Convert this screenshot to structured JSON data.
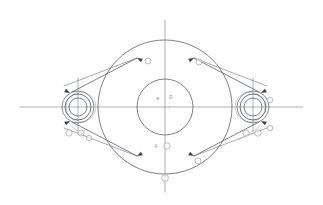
{
  "drawing": {
    "title": "Flange Plate Outline Sketch",
    "type": "cad-2d-technical-drawing",
    "canvas": {
      "width": 323,
      "height": 205,
      "background": "#ffffff"
    },
    "colors": {
      "geometry_line": "#5c6066",
      "centerline": "#8a8d92",
      "annotation_gray": "#b4b4b4",
      "annotation_text": "#9a9a9a",
      "marker_fill": "#ffffff",
      "arrow_fill": "#3c4046"
    },
    "main_circle": {
      "name": "main-outer-circle",
      "cx": 165,
      "cy": 107,
      "r": 67,
      "stroke": "#5c6066",
      "stroke_width": 0.8
    },
    "inner_circle": {
      "name": "main-inner-circle",
      "cx": 165,
      "cy": 107,
      "r": 28,
      "stroke": "#5c6066",
      "stroke_width": 0.8
    },
    "left_boss": {
      "name": "left-boss",
      "cx": 78,
      "cy": 107,
      "circles": [
        {
          "r": 16,
          "stroke": "#6a6e74",
          "stroke_width": 0.8
        },
        {
          "r": 13,
          "stroke": "#5c6066",
          "stroke_width": 0.9
        },
        {
          "r": 9,
          "stroke": "#5c6066",
          "stroke_width": 0.8
        }
      ],
      "ghost_circle": {
        "cx": 81,
        "cy": 107,
        "r": 15,
        "stroke": "#c2c2c2",
        "stroke_width": 0.8
      }
    },
    "right_boss": {
      "name": "right-boss",
      "cx": 253,
      "cy": 107,
      "circles": [
        {
          "r": 16,
          "stroke": "#6a6e74",
          "stroke_width": 0.8
        },
        {
          "r": 13,
          "stroke": "#5c6066",
          "stroke_width": 0.9
        },
        {
          "r": 9,
          "stroke": "#5c6066",
          "stroke_width": 0.8
        }
      ],
      "ghost_circle": {
        "cx": 250,
        "cy": 107,
        "r": 15,
        "stroke": "#c2c2c2",
        "stroke_width": 0.8
      }
    },
    "centerlines": [
      {
        "name": "horizontal-main-centerline",
        "x1": 20,
        "y1": 107,
        "x2": 303,
        "y2": 107,
        "stroke": "#8a8d92",
        "stroke_width": 0.7
      },
      {
        "name": "vertical-main-centerline",
        "x1": 165,
        "y1": 20,
        "x2": 165,
        "y2": 192,
        "stroke": "#8a8d92",
        "stroke_width": 0.7
      },
      {
        "name": "vertical-left-boss-centerline",
        "x1": 78,
        "y1": 78,
        "x2": 78,
        "y2": 132,
        "stroke": "#8a8d92",
        "stroke_width": 0.7
      },
      {
        "name": "vertical-right-boss-centerline",
        "x1": 253,
        "y1": 78,
        "x2": 253,
        "y2": 132,
        "stroke": "#8a8d92",
        "stroke_width": 0.7
      }
    ],
    "tangent_lines": [
      {
        "name": "tangent-upper-left",
        "x1": 72,
        "y1": 92,
        "x2": 137,
        "y2": 58,
        "stroke": "#5c6066",
        "stroke_width": 0.8
      },
      {
        "name": "tangent-upper-right",
        "x1": 259,
        "y1": 92,
        "x2": 194,
        "y2": 58,
        "stroke": "#5c6066",
        "stroke_width": 0.8
      },
      {
        "name": "tangent-lower-left",
        "x1": 72,
        "y1": 122,
        "x2": 137,
        "y2": 156,
        "stroke": "#5c6066",
        "stroke_width": 0.8
      },
      {
        "name": "tangent-lower-right",
        "x1": 259,
        "y1": 122,
        "x2": 194,
        "y2": 156,
        "stroke": "#5c6066",
        "stroke_width": 0.8
      },
      {
        "name": "leader-upper-left-secondary",
        "x1": 64,
        "y1": 86,
        "x2": 137,
        "y2": 58,
        "stroke": "#6a6e74",
        "stroke_width": 0.6
      },
      {
        "name": "leader-upper-right-secondary",
        "x1": 267,
        "y1": 86,
        "x2": 194,
        "y2": 58,
        "stroke": "#6a6e74",
        "stroke_width": 0.6
      },
      {
        "name": "leader-lower-left-secondary",
        "x1": 64,
        "y1": 128,
        "x2": 137,
        "y2": 156,
        "stroke": "#6a6e74",
        "stroke_width": 0.6
      },
      {
        "name": "leader-lower-right-secondary",
        "x1": 267,
        "y1": 128,
        "x2": 194,
        "y2": 156,
        "stroke": "#6a6e74",
        "stroke_width": 0.6
      }
    ],
    "arrow_markers": [
      {
        "name": "arrow-arc-upper-left",
        "x": 137,
        "y": 58,
        "angle": 208
      },
      {
        "name": "arrow-arc-upper-right",
        "x": 194,
        "y": 58,
        "angle": 332
      },
      {
        "name": "arrow-arc-lower-left",
        "x": 137,
        "y": 156,
        "angle": 152
      },
      {
        "name": "arrow-arc-lower-right",
        "x": 194,
        "y": 156,
        "angle": 28
      },
      {
        "name": "arrow-left-boss-upper",
        "x": 70,
        "y": 93,
        "angle": 28
      },
      {
        "name": "arrow-left-boss-lower",
        "x": 70,
        "y": 121,
        "angle": 332
      },
      {
        "name": "arrow-right-boss-upper",
        "x": 261,
        "y": 93,
        "angle": 152
      },
      {
        "name": "arrow-right-boss-lower",
        "x": 261,
        "y": 121,
        "angle": 208
      }
    ],
    "dimension_markers": [
      {
        "name": "marker-arc-upper-left",
        "cx": 148,
        "cy": 61,
        "r": 3.0
      },
      {
        "name": "marker-arc-upper-right",
        "cx": 199,
        "cy": 62,
        "r": 3.0
      },
      {
        "name": "marker-arc-lower-right",
        "cx": 198,
        "cy": 161,
        "r": 3.0
      },
      {
        "name": "marker-bottom-centerline",
        "cx": 165,
        "cy": 178,
        "r": 3.4
      },
      {
        "name": "marker-below-inner-circle",
        "cx": 167,
        "cy": 146,
        "r": 3.2
      },
      {
        "name": "marker-left-boss-a",
        "cx": 69,
        "cy": 133,
        "r": 3.2
      },
      {
        "name": "marker-left-boss-b",
        "cx": 81,
        "cy": 133,
        "r": 3.0
      },
      {
        "name": "marker-left-boss-c",
        "cx": 89,
        "cy": 138,
        "r": 2.6
      },
      {
        "name": "marker-right-boss-a",
        "cx": 246,
        "cy": 133,
        "r": 3.2
      },
      {
        "name": "marker-right-boss-b",
        "cx": 258,
        "cy": 133,
        "r": 3.2
      },
      {
        "name": "marker-right-boss-c",
        "cx": 270,
        "cy": 128,
        "r": 2.8
      },
      {
        "name": "marker-right-boss-d",
        "cx": 270,
        "cy": 100,
        "r": 2.8
      }
    ],
    "text_annotations": [
      {
        "name": "label-inner-left",
        "text": "ø",
        "x": 158,
        "y": 100
      },
      {
        "name": "label-inner-right",
        "text": "R",
        "x": 171,
        "y": 99
      },
      {
        "name": "label-inner-below",
        "text": "⏐",
        "x": 170,
        "y": 110
      },
      {
        "name": "label-below-circle",
        "text": "A",
        "x": 156,
        "y": 148
      }
    ],
    "leader_lines_small": [
      {
        "name": "leader-left-boss-callout",
        "x1": 72,
        "y1": 127,
        "x2": 92,
        "y2": 140,
        "stroke": "#b4b4b4",
        "stroke_width": 0.6
      },
      {
        "name": "leader-right-boss-callout",
        "x1": 259,
        "y1": 127,
        "x2": 239,
        "y2": 140,
        "stroke": "#b4b4b4",
        "stroke_width": 0.6
      }
    ]
  }
}
